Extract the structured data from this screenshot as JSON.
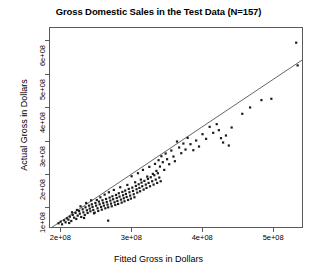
{
  "chart_data": {
    "type": "scatter",
    "title": "Gross Domestic Sales in the Test Data (N=157)",
    "xlabel": "Fitted Gross in Dollars",
    "ylabel": "Actual Gross in Dollars",
    "xtick_labels": [
      "2e+08",
      "3e+08",
      "4e+08",
      "5e+08"
    ],
    "xtick_values": [
      200000000,
      300000000,
      400000000,
      500000000
    ],
    "ytick_labels": [
      "1e+08",
      "2e+08",
      "3e+08",
      "4e+08",
      "5e+08",
      "6e+08"
    ],
    "ytick_values": [
      100000000,
      200000000,
      300000000,
      400000000,
      500000000,
      600000000
    ],
    "xlim": [
      184000000,
      542000000
    ],
    "ylim": [
      38000000,
      640000000
    ],
    "grid": false,
    "legend": null,
    "n_points": 157,
    "marker": "filled-square",
    "marker_color": "#1a1a1a",
    "fit_line": {
      "name": "y = x reference line",
      "color": "#555555",
      "x": [
        186000000,
        540000000
      ],
      "y": [
        42000000,
        545000000
      ]
    },
    "points": [
      [
        196000000,
        55000000
      ],
      [
        199000000,
        60000000
      ],
      [
        201000000,
        52000000
      ],
      [
        204000000,
        64000000
      ],
      [
        206000000,
        58000000
      ],
      [
        208000000,
        70000000
      ],
      [
        210000000,
        66000000
      ],
      [
        212000000,
        75000000
      ],
      [
        214000000,
        62000000
      ],
      [
        216000000,
        80000000
      ],
      [
        218000000,
        72000000
      ],
      [
        220000000,
        86000000
      ],
      [
        221000000,
        68000000
      ],
      [
        223000000,
        78000000
      ],
      [
        225000000,
        92000000
      ],
      [
        226000000,
        84000000
      ],
      [
        228000000,
        74000000
      ],
      [
        230000000,
        97000000
      ],
      [
        231000000,
        88000000
      ],
      [
        233000000,
        80000000
      ],
      [
        234000000,
        103000000
      ],
      [
        236000000,
        94000000
      ],
      [
        237000000,
        86000000
      ],
      [
        239000000,
        108000000
      ],
      [
        240000000,
        99000000
      ],
      [
        241000000,
        91000000
      ],
      [
        243000000,
        112000000
      ],
      [
        244000000,
        104000000
      ],
      [
        245000000,
        95000000
      ],
      [
        247000000,
        87000000
      ],
      [
        248000000,
        116000000
      ],
      [
        249000000,
        108000000
      ],
      [
        251000000,
        100000000
      ],
      [
        252000000,
        92000000
      ],
      [
        253000000,
        120000000
      ],
      [
        254000000,
        112000000
      ],
      [
        256000000,
        104000000
      ],
      [
        257000000,
        96000000
      ],
      [
        258000000,
        124000000
      ],
      [
        259000000,
        116000000
      ],
      [
        260000000,
        108000000
      ],
      [
        262000000,
        100000000
      ],
      [
        263000000,
        128000000
      ],
      [
        264000000,
        119000000
      ],
      [
        265000000,
        111000000
      ],
      [
        266000000,
        103000000
      ],
      [
        268000000,
        132000000
      ],
      [
        269000000,
        123000000
      ],
      [
        270000000,
        114000000
      ],
      [
        271000000,
        106000000
      ],
      [
        272000000,
        136000000
      ],
      [
        273000000,
        127000000
      ],
      [
        275000000,
        118000000
      ],
      [
        276000000,
        110000000
      ],
      [
        277000000,
        140000000
      ],
      [
        278000000,
        131000000
      ],
      [
        279000000,
        122000000
      ],
      [
        280000000,
        113000000
      ],
      [
        281000000,
        145000000
      ],
      [
        282000000,
        135000000
      ],
      [
        284000000,
        126000000
      ],
      [
        285000000,
        117000000
      ],
      [
        286000000,
        149000000
      ],
      [
        287000000,
        139000000
      ],
      [
        288000000,
        130000000
      ],
      [
        289000000,
        121000000
      ],
      [
        290000000,
        153000000
      ],
      [
        291000000,
        143000000
      ],
      [
        292000000,
        134000000
      ],
      [
        294000000,
        125000000
      ],
      [
        295000000,
        158000000
      ],
      [
        296000000,
        148000000
      ],
      [
        297000000,
        138000000
      ],
      [
        298000000,
        129000000
      ],
      [
        300000000,
        162000000
      ],
      [
        301000000,
        152000000
      ],
      [
        302000000,
        142000000
      ],
      [
        303000000,
        133000000
      ],
      [
        305000000,
        167000000
      ],
      [
        306000000,
        157000000
      ],
      [
        307000000,
        147000000
      ],
      [
        309000000,
        172000000
      ],
      [
        310000000,
        161000000
      ],
      [
        311000000,
        151000000
      ],
      [
        313000000,
        177000000
      ],
      [
        314000000,
        166000000
      ],
      [
        316000000,
        156000000
      ],
      [
        317000000,
        182000000
      ],
      [
        319000000,
        171000000
      ],
      [
        320000000,
        161000000
      ],
      [
        322000000,
        188000000
      ],
      [
        323000000,
        176000000
      ],
      [
        325000000,
        166000000
      ],
      [
        326000000,
        193000000
      ],
      [
        328000000,
        181000000
      ],
      [
        330000000,
        171000000
      ],
      [
        331000000,
        199000000
      ],
      [
        333000000,
        186000000
      ],
      [
        335000000,
        176000000
      ],
      [
        336000000,
        205000000
      ],
      [
        338000000,
        192000000
      ],
      [
        340000000,
        181000000
      ],
      [
        250000000,
        125000000
      ],
      [
        255000000,
        133000000
      ],
      [
        261000000,
        141000000
      ],
      [
        267000000,
        148000000
      ],
      [
        274000000,
        155000000
      ],
      [
        283000000,
        163000000
      ],
      [
        293000000,
        170000000
      ],
      [
        304000000,
        178000000
      ],
      [
        312000000,
        186000000
      ],
      [
        321000000,
        195000000
      ],
      [
        329000000,
        203000000
      ],
      [
        334000000,
        212000000
      ],
      [
        227000000,
        106000000
      ],
      [
        235000000,
        116000000
      ],
      [
        242000000,
        124000000
      ],
      [
        246000000,
        85000000
      ],
      [
        232000000,
        71000000
      ],
      [
        222000000,
        95000000
      ],
      [
        215000000,
        88000000
      ],
      [
        211000000,
        56000000
      ],
      [
        266000000,
        63000000
      ],
      [
        299000000,
        196000000
      ],
      [
        308000000,
        205000000
      ],
      [
        315000000,
        215000000
      ],
      [
        324000000,
        224000000
      ],
      [
        332000000,
        233000000
      ],
      [
        337000000,
        244000000
      ],
      [
        339000000,
        225000000
      ],
      [
        341000000,
        256000000
      ],
      [
        343000000,
        238000000
      ],
      [
        345000000,
        215000000
      ],
      [
        347000000,
        264000000
      ],
      [
        349000000,
        247000000
      ],
      [
        352000000,
        232000000
      ],
      [
        355000000,
        273000000
      ],
      [
        358000000,
        255000000
      ],
      [
        360000000,
        241000000
      ],
      [
        363000000,
        300000000
      ],
      [
        366000000,
        282000000
      ],
      [
        369000000,
        265000000
      ],
      [
        372000000,
        294000000
      ],
      [
        375000000,
        276000000
      ],
      [
        378000000,
        311000000
      ],
      [
        382000000,
        292000000
      ],
      [
        386000000,
        274000000
      ],
      [
        390000000,
        303000000
      ],
      [
        394000000,
        285000000
      ],
      [
        399000000,
        322000000
      ],
      [
        404000000,
        308000000
      ],
      [
        409000000,
        344000000
      ],
      [
        414000000,
        326000000
      ],
      [
        419000000,
        352000000
      ],
      [
        422000000,
        334000000
      ],
      [
        425000000,
        310000000
      ],
      [
        428000000,
        297000000
      ],
      [
        432000000,
        318000000
      ],
      [
        436000000,
        288000000
      ],
      [
        440000000,
        342000000
      ],
      [
        455000000,
        383000000
      ],
      [
        466000000,
        402000000
      ],
      [
        482000000,
        424000000
      ],
      [
        496000000,
        428000000
      ],
      [
        531000000,
        596000000
      ],
      [
        533000000,
        528000000
      ]
    ]
  }
}
